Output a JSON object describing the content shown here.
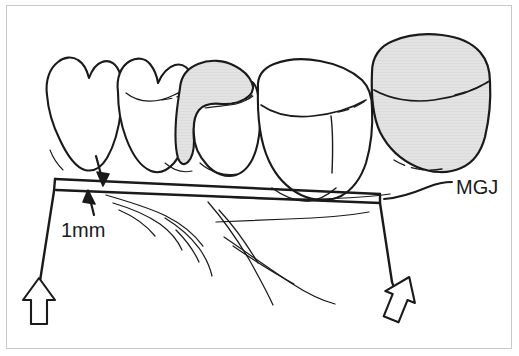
{
  "figure": {
    "background_color": "#ffffff",
    "frame_color": "#c9c9c9",
    "ink_color": "#1a1a1a",
    "shaded_fill_color": "#e2e2e2",
    "annotations": {
      "measurement_label": "1mm",
      "junction_label": "MGJ"
    },
    "teeth": [
      {
        "name": "tooth-premolar-first",
        "shaded": false
      },
      {
        "name": "tooth-premolar-second",
        "shaded": false
      },
      {
        "name": "tooth-molar-shaded-crown",
        "shaded": true
      },
      {
        "name": "tooth-molar-large",
        "shaded": false
      },
      {
        "name": "tooth-molar-crown-shaded",
        "shaded": true
      }
    ],
    "markers": [
      {
        "name": "arrow-marker-left",
        "direction": "up"
      },
      {
        "name": "arrow-marker-right",
        "direction": "up-left"
      },
      {
        "name": "arrow-measure-down",
        "direction": "down"
      },
      {
        "name": "arrow-measure-up",
        "direction": "up"
      }
    ]
  }
}
